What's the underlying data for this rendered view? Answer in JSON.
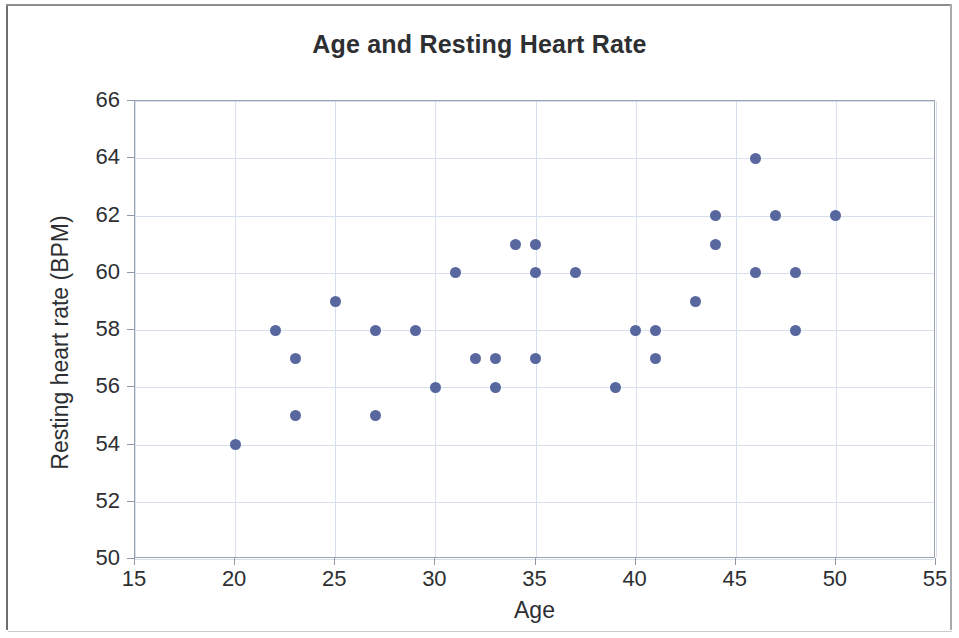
{
  "chart_data": {
    "type": "scatter",
    "title": "Age and Resting Heart Rate",
    "xlabel": "Age",
    "ylabel": "Resting heart rate (BPM)",
    "xlim": [
      15,
      55
    ],
    "ylim": [
      50,
      66
    ],
    "xticks": [
      15,
      20,
      25,
      30,
      35,
      40,
      45,
      50,
      55
    ],
    "yticks": [
      50,
      52,
      54,
      56,
      58,
      60,
      62,
      64,
      66
    ],
    "grid": true,
    "legend": false,
    "marker_color": "#4a5a96",
    "gridline_color": "#d6dfeb",
    "axis_color": "#9aa3b0",
    "text_color": "#2d2f33",
    "series": [
      {
        "name": "Participants",
        "points": [
          [
            20,
            54
          ],
          [
            22,
            58
          ],
          [
            23,
            57
          ],
          [
            23,
            55
          ],
          [
            25,
            59
          ],
          [
            27,
            58
          ],
          [
            27,
            55
          ],
          [
            29,
            58
          ],
          [
            30,
            56
          ],
          [
            31,
            60
          ],
          [
            32,
            57
          ],
          [
            33,
            57
          ],
          [
            33,
            56
          ],
          [
            34,
            61
          ],
          [
            35,
            61
          ],
          [
            35,
            60
          ],
          [
            35,
            57
          ],
          [
            37,
            60
          ],
          [
            39,
            56
          ],
          [
            40,
            58
          ],
          [
            41,
            58
          ],
          [
            41,
            57
          ],
          [
            43,
            59
          ],
          [
            44,
            62
          ],
          [
            44,
            61
          ],
          [
            46,
            64
          ],
          [
            46,
            60
          ],
          [
            47,
            62
          ],
          [
            48,
            60
          ],
          [
            48,
            58
          ],
          [
            50,
            62
          ]
        ]
      }
    ]
  }
}
